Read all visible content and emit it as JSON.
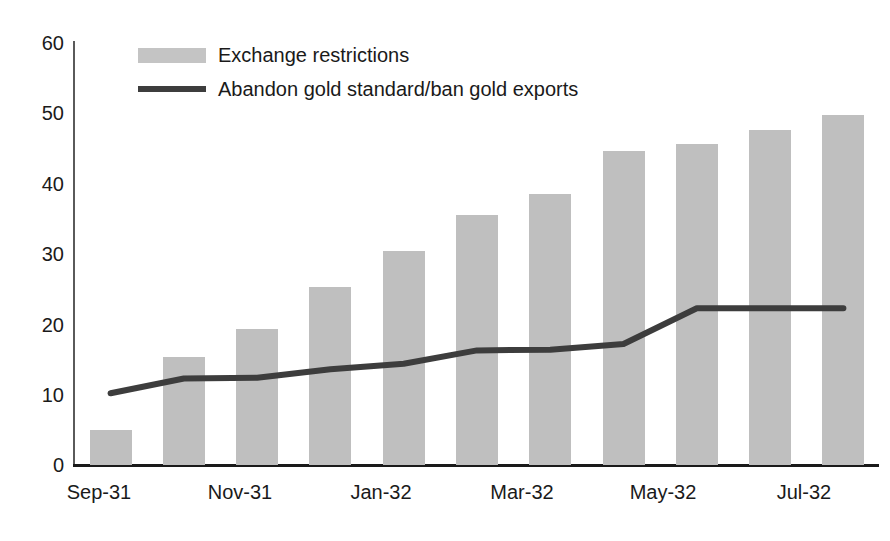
{
  "chart_data": {
    "type": "bar",
    "title": "",
    "xlabel": "",
    "ylabel": "",
    "ylim": [
      0,
      60
    ],
    "yticks": [
      0,
      10,
      20,
      30,
      40,
      50,
      60
    ],
    "grid": false,
    "legend_position": "top-left",
    "categories": [
      "Sep-31",
      "Oct-31",
      "Nov-31",
      "Dec-31",
      "Jan-32",
      "Feb-32",
      "Mar-32",
      "Apr-32",
      "May-32",
      "Jun-32",
      "Jul-32"
    ],
    "xtick_labels": [
      "Sep-31",
      "Nov-31",
      "Jan-32",
      "Mar-32",
      "May-32",
      "Jul-32"
    ],
    "xtick_indices": [
      0,
      2,
      4,
      6,
      8,
      10
    ],
    "series": [
      {
        "name": "Exchange restrictions",
        "type": "bar",
        "color": "#bfbfbf",
        "values": [
          5,
          15.3,
          19.3,
          25.3,
          30.4,
          35.5,
          38.6,
          44.6,
          45.7,
          47.6,
          49.7
        ]
      },
      {
        "name": "Abandon gold standard/ban gold exports",
        "type": "line",
        "color": "#3d3d3d",
        "values": [
          10.2,
          12.3,
          12.4,
          13.6,
          14.4,
          16.3,
          16.4,
          17.2,
          22.3,
          22.3,
          22.3
        ]
      }
    ]
  },
  "legend": {
    "items": [
      {
        "label": "Exchange restrictions",
        "marker": "bar-swatch"
      },
      {
        "label": "Abandon gold standard/ban gold exports",
        "marker": "line-swatch"
      }
    ]
  },
  "axes": {
    "y_tick_labels": [
      "60",
      "50",
      "40",
      "30",
      "20",
      "10",
      "0"
    ],
    "x_tick_labels": [
      "Sep-31",
      "Nov-31",
      "Jan-32",
      "Mar-32",
      "May-32",
      "Jul-32"
    ]
  },
  "colors": {
    "bar_fill": "#bfbfbf",
    "line_stroke": "#3d3d3d",
    "axis": "#1a1a1a",
    "y_axis": "#5a5a5a",
    "text": "#1a1a1a",
    "background": "#ffffff"
  }
}
